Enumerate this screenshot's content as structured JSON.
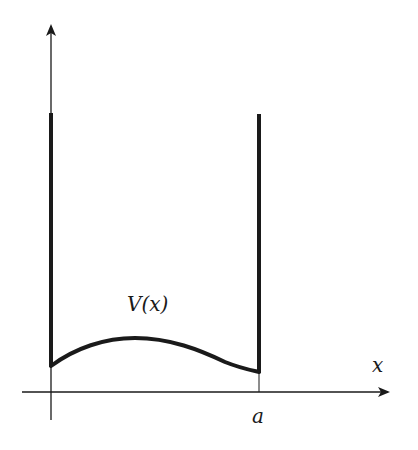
{
  "diagram": {
    "type": "potential-well",
    "labels": {
      "potential": "V(x)",
      "x_axis": "x",
      "wall_position": "a"
    },
    "colors": {
      "line": "#1a1a1a",
      "background": "#ffffff"
    },
    "elements": [
      {
        "id": "vertical-axis",
        "kind": "arrow",
        "direction": "up"
      },
      {
        "id": "x-axis",
        "kind": "arrow",
        "direction": "right"
      },
      {
        "id": "left-wall",
        "kind": "thick-line",
        "at": "0"
      },
      {
        "id": "right-wall",
        "kind": "thick-line",
        "at": "a"
      },
      {
        "id": "potential-curve",
        "kind": "curve",
        "label": "V(x)"
      }
    ]
  }
}
